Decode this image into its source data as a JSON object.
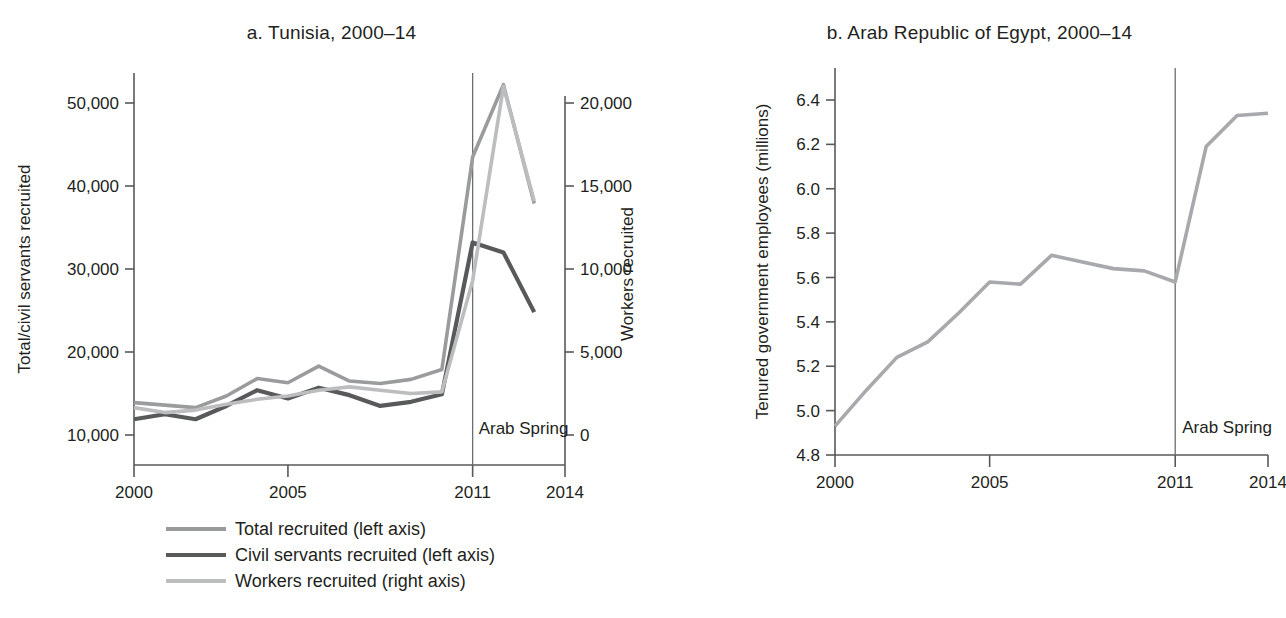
{
  "figure": {
    "clipped_header_text": "",
    "background": "#ffffff"
  },
  "panel_a": {
    "title": "a. Tunisia, 2000–14",
    "y_left_title": "Total/civil servants recruited",
    "y_right_title": "Workers recruited",
    "y_left_ticks": [
      "10,000",
      "20,000",
      "30,000",
      "40,000",
      "50,000"
    ],
    "y_right_ticks": [
      "0",
      "5,000",
      "10,000",
      "15,000",
      "20,000"
    ],
    "x_ticks": [
      "2000",
      "2005",
      "2011",
      "2014"
    ],
    "event_label": "Arab Spring",
    "event_year": 2011
  },
  "panel_b": {
    "title": "b. Arab Republic of Egypt, 2000–14",
    "y_title": "Tenured government employees (millions)",
    "y_ticks": [
      "4.8",
      "5.0",
      "5.2",
      "5.4",
      "5.6",
      "5.8",
      "6.0",
      "6.2",
      "6.4"
    ],
    "x_ticks": [
      "2000",
      "2005",
      "2011",
      "2014"
    ],
    "event_label": "Arab Spring",
    "event_year": 2011
  },
  "legend": {
    "items": [
      {
        "label": "Total recruited (left axis)",
        "color": "#9a9b9d"
      },
      {
        "label": "Civil servants recruited (left axis)",
        "color": "#58595b"
      },
      {
        "label": "Workers recruited (right axis)",
        "color": "#bcbdbf"
      }
    ]
  },
  "chart_data": [
    {
      "type": "line",
      "id": "tunisia",
      "title": "a. Tunisia, 2000–14",
      "xlabel": "",
      "ylabel": "Total/civil servants recruited",
      "ylabel_right": "Workers recruited",
      "x": [
        2000,
        2001,
        2002,
        2003,
        2004,
        2005,
        2006,
        2007,
        2008,
        2009,
        2010,
        2011,
        2012,
        2013
      ],
      "xlim": [
        2000,
        2014
      ],
      "ylim": [
        7000,
        54500
      ],
      "ylim_right": [
        -1000,
        21500
      ],
      "xticks": [
        2000,
        2005,
        2011,
        2014
      ],
      "yticks": [
        10000,
        20000,
        30000,
        40000,
        50000
      ],
      "yticks_right": [
        0,
        5000,
        10000,
        15000,
        20000
      ],
      "grid": false,
      "legend_position": "below-left",
      "annotations": [
        {
          "text": "Arab Spring",
          "x": 2011,
          "kind": "vertical-line"
        }
      ],
      "series": [
        {
          "name": "Total recruited (left axis)",
          "axis": "left",
          "color": "#9a9b9d",
          "values": [
            13900,
            13600,
            13300,
            14700,
            16800,
            16300,
            18300,
            16500,
            16200,
            16700,
            17900,
            43500,
            52200,
            37900
          ]
        },
        {
          "name": "Civil servants recruited (left axis)",
          "axis": "left",
          "color": "#58595b",
          "values": [
            11900,
            12500,
            11900,
            13500,
            15400,
            14400,
            15700,
            14800,
            13500,
            14000,
            14900,
            33200,
            32000,
            24800
          ]
        },
        {
          "name": "Workers recruited (right axis)",
          "axis": "right",
          "color": "#bcbdbf",
          "values": [
            1650,
            1350,
            1500,
            1850,
            2150,
            2350,
            2700,
            2900,
            2700,
            2500,
            2600,
            9300,
            21000,
            14100
          ]
        }
      ]
    },
    {
      "type": "line",
      "id": "egypt",
      "title": "b. Arab Republic of Egypt, 2000–14",
      "xlabel": "",
      "ylabel": "Tenured government employees (millions)",
      "x": [
        2000,
        2001,
        2002,
        2003,
        2004,
        2005,
        2006,
        2007,
        2008,
        2009,
        2010,
        2011,
        2012,
        2013,
        2014
      ],
      "xlim": [
        2000,
        2014
      ],
      "ylim": [
        4.8,
        6.52
      ],
      "xticks": [
        2000,
        2005,
        2011,
        2014
      ],
      "yticks": [
        4.8,
        5.0,
        5.2,
        5.4,
        5.6,
        5.8,
        6.0,
        6.2,
        6.4
      ],
      "grid": false,
      "annotations": [
        {
          "text": "Arab Spring",
          "x": 2011,
          "kind": "vertical-line"
        }
      ],
      "series": [
        {
          "name": "Tenured government employees (millions)",
          "color": "#a7a9ac",
          "values": [
            4.93,
            5.09,
            5.24,
            5.31,
            5.44,
            5.58,
            5.57,
            5.7,
            5.67,
            5.64,
            5.63,
            5.58,
            6.19,
            6.33,
            6.34
          ]
        }
      ]
    }
  ]
}
